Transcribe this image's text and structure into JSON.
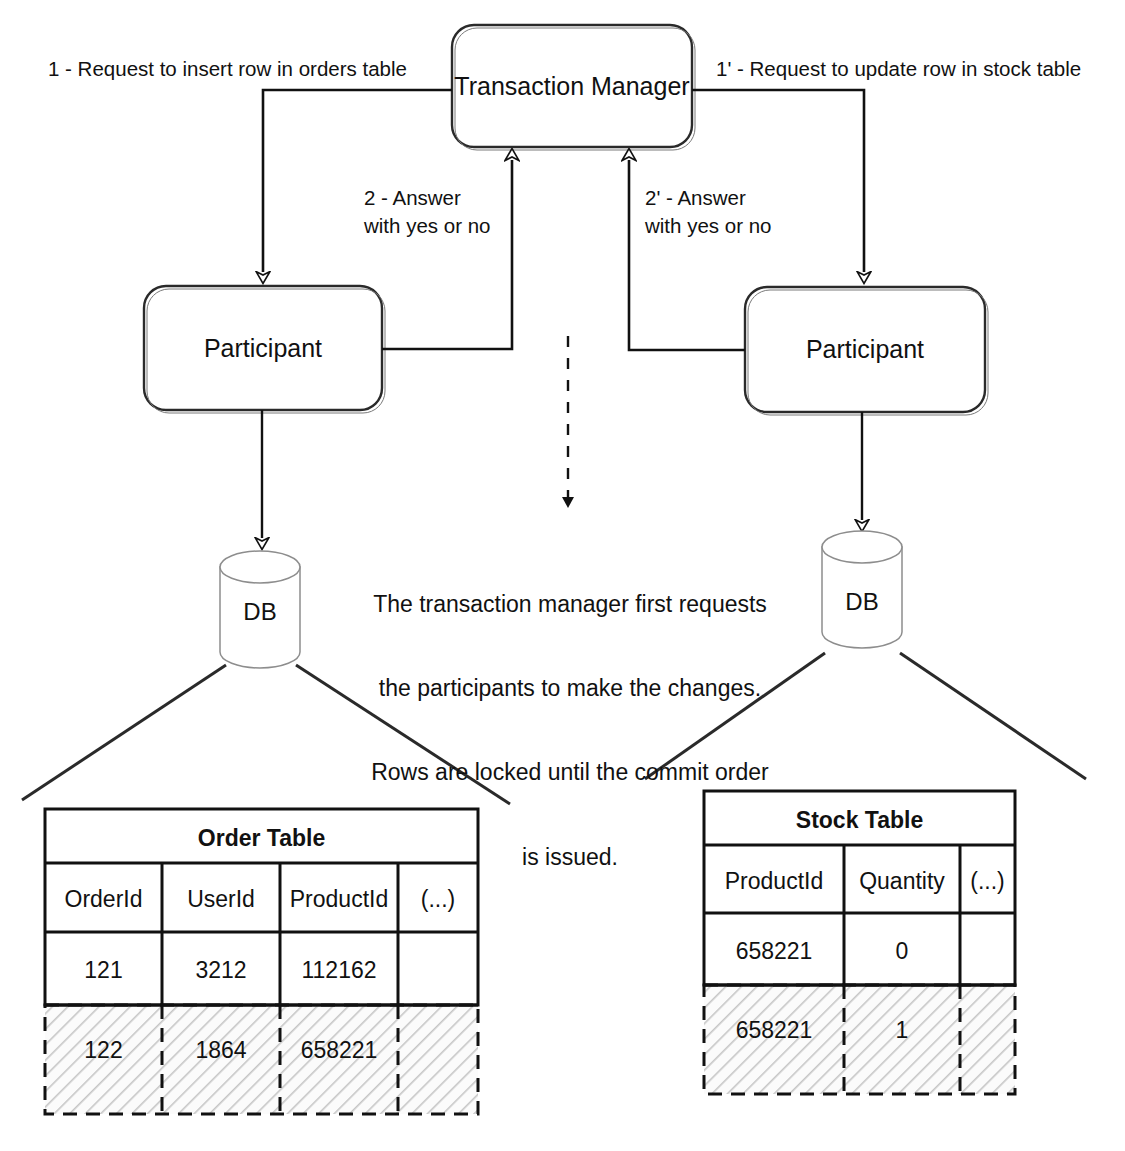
{
  "diagram": {
    "nodes": {
      "transaction_manager": "Transaction Manager",
      "participant_left": "Participant",
      "participant_right": "Participant",
      "db_left": "DB",
      "db_right": "DB"
    },
    "edge_labels": {
      "request_left": "1 - Request to insert row in orders table",
      "request_right": "1' - Request to update row in stock table",
      "answer_left_line1": "2 - Answer",
      "answer_left_line2": "with yes or no",
      "answer_right_line1": "2' - Answer",
      "answer_right_line2": "with yes or no"
    },
    "note": {
      "line1": "The transaction manager first requests",
      "line2": "the participants to make the changes.",
      "line3": "Rows are locked until the commit order",
      "line4": "is issued."
    }
  },
  "tables": [
    {
      "name": "order-table",
      "title": "Order Table",
      "columns": [
        "OrderId",
        "UserId",
        "ProductId",
        "(...)"
      ],
      "rows": [
        {
          "cells": [
            "121",
            "3212",
            "112162",
            ""
          ],
          "locked": false
        },
        {
          "cells": [
            "122",
            "1864",
            "658221",
            ""
          ],
          "locked": true
        }
      ]
    },
    {
      "name": "stock-table",
      "title": "Stock Table",
      "columns": [
        "ProductId",
        "Quantity",
        "(...)"
      ],
      "rows": [
        {
          "cells": [
            "658221",
            "0",
            ""
          ],
          "locked": false
        },
        {
          "cells": [
            "658221",
            "1",
            ""
          ],
          "locked": true
        }
      ]
    }
  ],
  "colors": {
    "ink": "#111111",
    "background": "#ffffff",
    "hatch": "#b9b9b9"
  }
}
